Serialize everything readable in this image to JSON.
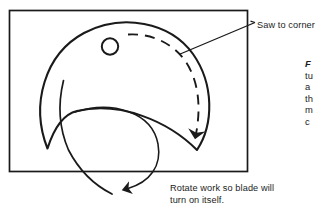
{
  "figure": {
    "type": "technical-illustration",
    "frame": {
      "shape": "rectangle",
      "stroke_color": "#1a1a1a",
      "x": 9,
      "y": 10,
      "width": 239,
      "height": 162
    },
    "background_color": "#ffffff",
    "line_color": "#1a1a1a"
  },
  "callouts": {
    "saw_to_corner": {
      "label": "Saw to corner",
      "leader": "line from text to dashed cut path"
    },
    "rotate_work": {
      "line1": "Rotate work so blade will",
      "line2": "turn on itself.",
      "leader": "curved line with solid arrowhead"
    }
  },
  "figure_caption": {
    "rows": [
      "F",
      "tu",
      "a",
      "th",
      "m",
      "c"
    ],
    "note": "clipped at right image edge"
  },
  "drawing_elements": {
    "workpiece": "crescent / moon-shaped blank",
    "pilot_hole": "small circle near top of blank",
    "cut_path": "dashed arc following inside of outer curve",
    "cut_direction_arrow": "solid arrowhead pointing down at end of dashed arc",
    "rotation_arrow": "solid arrowhead pointing right toward caption"
  },
  "colors": {
    "ink": "#1a1a1a",
    "paper": "#ffffff"
  }
}
